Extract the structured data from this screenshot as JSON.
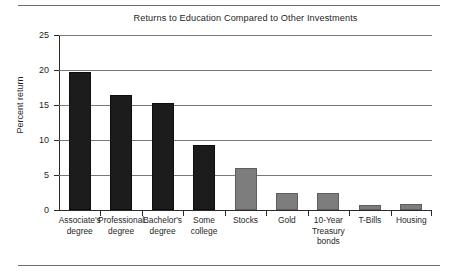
{
  "chart_data": {
    "type": "bar",
    "title": "Returns to Education Compared to Other Investments",
    "xlabel": "",
    "ylabel": "Percent return",
    "ylim": [
      0,
      25
    ],
    "yticks": [
      0,
      5,
      10,
      15,
      20,
      25
    ],
    "ytick_labels": [
      "0",
      "5",
      "10",
      "15",
      "20",
      "25"
    ],
    "grid": true,
    "legend": "none",
    "categories": [
      "Associate's degree",
      "Professional degree",
      "Bachelor's degree",
      "Some college",
      "Stocks",
      "Gold",
      "10-Year Treasury bonds",
      "T-Bills",
      "Housing"
    ],
    "category_lines": [
      [
        "Associate's",
        "degree"
      ],
      [
        "Professional",
        "degree"
      ],
      [
        "Bachelor's",
        "degree"
      ],
      [
        "Some",
        "college"
      ],
      [
        "Stocks"
      ],
      [
        "Gold"
      ],
      [
        "10-Year",
        "Treasury",
        "bonds"
      ],
      [
        "T-Bills"
      ],
      [
        "Housing"
      ]
    ],
    "values": [
      19.7,
      16.4,
      15.3,
      9.3,
      6.0,
      2.4,
      2.4,
      0.7,
      0.8
    ],
    "bar_colors": [
      "#1c1c1c",
      "#1c1c1c",
      "#1c1c1c",
      "#1c1c1c",
      "#7d7d7d",
      "#7d7d7d",
      "#7d7d7d",
      "#7d7d7d",
      "#7d7d7d"
    ]
  }
}
